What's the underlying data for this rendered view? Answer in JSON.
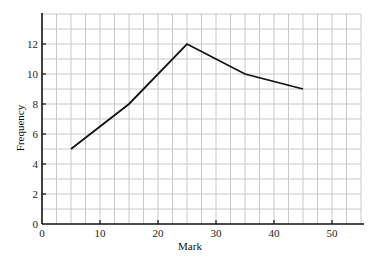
{
  "chart_data": {
    "type": "line",
    "title": "",
    "xlabel": "Mark",
    "ylabel": "Frequency",
    "x": [
      5,
      15,
      25,
      35,
      45
    ],
    "series": [
      {
        "name": "Frequency",
        "values": [
          5,
          8,
          12,
          10,
          9
        ],
        "color": "#111111"
      }
    ],
    "xlim": [
      0,
      55
    ],
    "ylim": [
      0,
      14
    ],
    "x_ticks": [
      0,
      10,
      20,
      30,
      40,
      50
    ],
    "y_ticks": [
      0,
      2,
      4,
      6,
      8,
      10,
      12
    ],
    "grid": {
      "on": true,
      "x_step": 2.5,
      "y_step": 1,
      "color": "#c8c8c8"
    },
    "legend": null
  },
  "labels": {
    "xlabel": "Mark",
    "ylabel": "Frequency"
  }
}
